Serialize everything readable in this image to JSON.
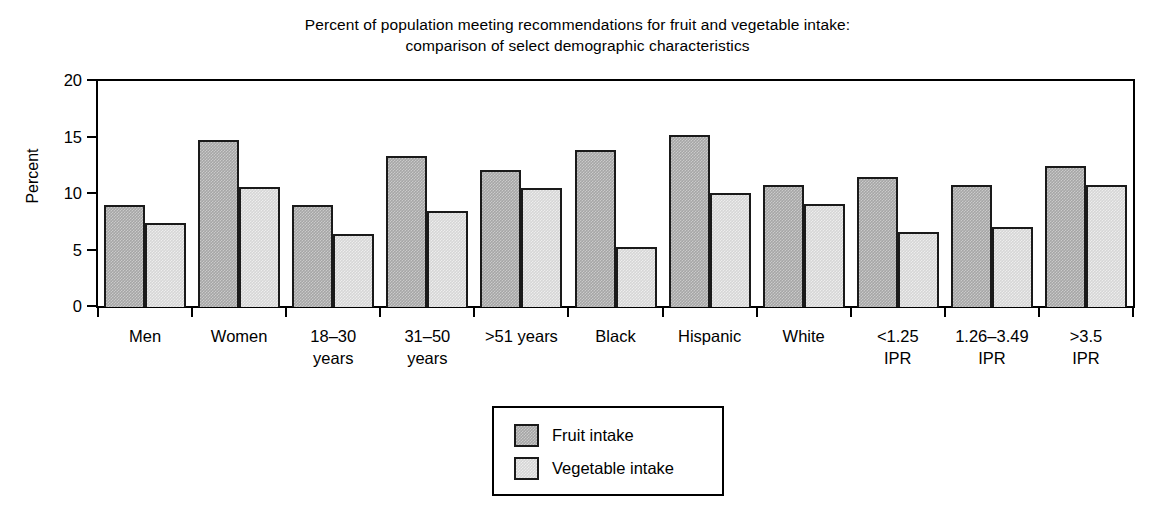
{
  "chart_data": {
    "type": "bar",
    "title": "Percent of population meeting recommendations for fruit and vegetable intake: comparison of select demographic characteristics",
    "title_lines": [
      "Percent of population meeting recommendations for fruit and vegetable intake:",
      "comparison of select demographic characteristics"
    ],
    "xlabel": "",
    "ylabel": "Percent",
    "ylim": [
      0,
      20
    ],
    "yticks": [
      0,
      5,
      10,
      15,
      20
    ],
    "ytick_labels": [
      "0",
      "5",
      "10",
      "15",
      "20"
    ],
    "grid": false,
    "legend_position": "bottom-center",
    "categories": [
      "Men",
      "Women",
      "18–30 years",
      "31–50 years",
      ">51 years",
      "Black",
      "Hispanic",
      "White",
      "<1.25 IPR",
      "1.26–3.49 IPR",
      ">3.5 IPR"
    ],
    "category_label_lines": [
      [
        "Men",
        ""
      ],
      [
        "Women",
        ""
      ],
      [
        "18–30",
        "years"
      ],
      [
        "31–50",
        "years"
      ],
      [
        ">51 years",
        ""
      ],
      [
        "Black",
        ""
      ],
      [
        "Hispanic",
        ""
      ],
      [
        "White",
        ""
      ],
      [
        "<1.25",
        "IPR"
      ],
      [
        "1.26–3.49",
        "IPR"
      ],
      [
        ">3.5",
        "IPR"
      ]
    ],
    "series": [
      {
        "name": "Fruit intake",
        "color": "#a6a6a6",
        "values": [
          9.0,
          14.8,
          9.0,
          13.4,
          12.1,
          13.9,
          15.2,
          10.8,
          11.5,
          10.8,
          12.5
        ]
      },
      {
        "name": "Vegetable intake",
        "color": "#d6d6d6",
        "values": [
          7.4,
          10.6,
          6.5,
          8.5,
          10.5,
          5.3,
          10.1,
          9.1,
          6.6,
          7.1,
          10.8
        ]
      }
    ]
  },
  "legend": {
    "items": [
      {
        "label": "Fruit intake",
        "color": "#a6a6a6"
      },
      {
        "label": "Vegetable intake",
        "color": "#d6d6d6"
      }
    ]
  }
}
